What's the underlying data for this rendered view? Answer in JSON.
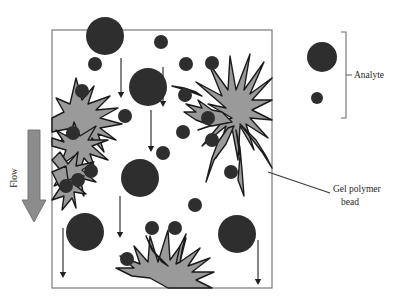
{
  "figure": {
    "type": "schematic-diagram",
    "title": ""
  },
  "colors": {
    "analyte_fill": "#2e2e2e",
    "gel_fill": "#9a9a9a",
    "gel_stroke": "#1a1a1a",
    "flow_arrow_fill": "#8c8c8c",
    "flow_arrow_stroke": "#6e6e6e",
    "box_stroke": "#6e6e6e",
    "arrow_stroke": "#231f20",
    "leader_stroke": "#3a3a3a",
    "bracket_stroke": "#6e6e6e",
    "text": "#231f20",
    "background": "#ffffff"
  },
  "labels": {
    "flow": "Flow",
    "analyte": "Analyte",
    "gel_polymer_bead_line1": "Gel polymer",
    "gel_polymer_bead_line2": "bead"
  },
  "column": {
    "box": {
      "x": 52,
      "y": 30,
      "width": 220,
      "height": 258
    }
  },
  "flow_arrow": {
    "direction": "down",
    "x": 34,
    "y_start": 130,
    "y_end": 222,
    "shaft_width": 12,
    "head_width": 24
  },
  "flow_direction_arrows": [
    {
      "x": 121,
      "y_start": 58,
      "y_end": 98
    },
    {
      "x": 151,
      "y_start": 110,
      "y_end": 152
    },
    {
      "x": 163,
      "y_start": 67,
      "y_end": 107
    },
    {
      "x": 120,
      "y_start": 196,
      "y_end": 238
    },
    {
      "x": 63,
      "y_start": 228,
      "y_end": 278
    },
    {
      "x": 258,
      "y_start": 240,
      "y_end": 285
    }
  ],
  "analytes": {
    "large": [
      {
        "cx": 105,
        "cy": 36,
        "r": 19
      },
      {
        "cx": 148,
        "cy": 87,
        "r": 19
      },
      {
        "cx": 140,
        "cy": 178,
        "r": 19
      },
      {
        "cx": 85,
        "cy": 232,
        "r": 19
      },
      {
        "cx": 237,
        "cy": 234,
        "r": 19
      }
    ],
    "small": [
      {
        "cx": 161,
        "cy": 42,
        "r": 7
      },
      {
        "cx": 95,
        "cy": 64,
        "r": 7
      },
      {
        "cx": 82,
        "cy": 91,
        "r": 7
      },
      {
        "cx": 125,
        "cy": 116,
        "r": 7
      },
      {
        "cx": 73,
        "cy": 133,
        "r": 7
      },
      {
        "cx": 78,
        "cy": 180,
        "r": 7
      },
      {
        "cx": 91,
        "cy": 171,
        "r": 7
      },
      {
        "cx": 66,
        "cy": 186,
        "r": 7
      },
      {
        "cx": 163,
        "cy": 153,
        "r": 7
      },
      {
        "cx": 185,
        "cy": 95,
        "r": 7
      },
      {
        "cx": 186,
        "cy": 64,
        "r": 7
      },
      {
        "cx": 212,
        "cy": 63,
        "r": 7
      },
      {
        "cx": 183,
        "cy": 132,
        "r": 7
      },
      {
        "cx": 212,
        "cy": 140,
        "r": 7
      },
      {
        "cx": 231,
        "cy": 172,
        "r": 7
      },
      {
        "cx": 195,
        "cy": 205,
        "r": 7
      },
      {
        "cx": 152,
        "cy": 228,
        "r": 7
      },
      {
        "cx": 175,
        "cy": 228,
        "r": 7
      },
      {
        "cx": 127,
        "cy": 259,
        "r": 7
      },
      {
        "cx": 208,
        "cy": 118,
        "r": 7
      }
    ]
  },
  "legend": {
    "analyte_large": {
      "cx": 322,
      "cy": 57,
      "r": 15
    },
    "analyte_small": {
      "cx": 317,
      "cy": 98,
      "r": 6
    },
    "bracket": {
      "x": 346,
      "y_top": 32,
      "y_bottom": 118,
      "tick": 5
    },
    "label_x": 360,
    "label_y": 78
  },
  "callout": {
    "leader_from": {
      "x": 268,
      "y": 172
    },
    "leader_to": {
      "x": 330,
      "y": 193
    },
    "label_x": 333,
    "label_y1": 192,
    "label_y2": 205
  }
}
